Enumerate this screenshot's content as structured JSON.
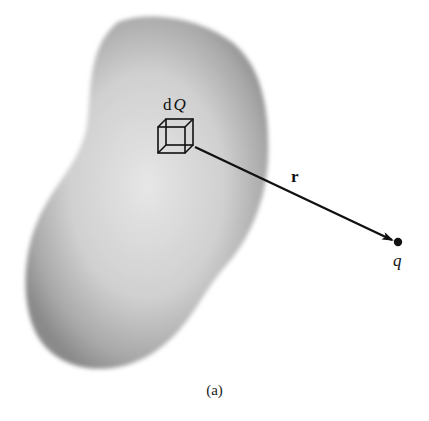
{
  "figure": {
    "caption": "(a)",
    "labels": {
      "charge_element": "dQ",
      "charge_element_d": "d",
      "charge_element_Q": "Q",
      "vector": "r",
      "point_charge": "q"
    },
    "elements": {
      "body": "continuous charge distribution (shaded blob)",
      "volume_element": "small cube (wireframe)",
      "vector_arrow": "arrow from volume element to point q",
      "point": "filled dot"
    },
    "colors": {
      "blob_center": "#e2e2e2",
      "blob_edge": "#8c8c8c",
      "line": "#111111",
      "background": "#ffffff"
    }
  }
}
